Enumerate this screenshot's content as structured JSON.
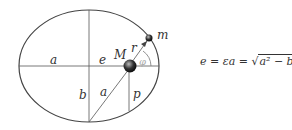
{
  "diagram": {
    "labels": {
      "semi_major_left": "a",
      "eccentric_distance": "e",
      "central_mass": "M",
      "orbiting_mass": "m",
      "radius": "r",
      "angle": "φ",
      "semi_minor": "b",
      "semi_major_diag": "a",
      "semi_latus": "p"
    },
    "colors": {
      "stroke": "#444444",
      "text": "#333333",
      "mass_fill": "#222222"
    }
  },
  "formula": {
    "lhs": "e",
    "eq1": " = ",
    "mid": "εa",
    "eq2": " = ",
    "sqrt_symbol": "√",
    "radicand": "a² − b²"
  }
}
